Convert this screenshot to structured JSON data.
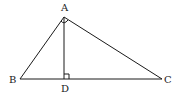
{
  "diagram": {
    "type": "geometry-triangle",
    "points": {
      "A": {
        "label": "A",
        "x": 64,
        "y": 17
      },
      "B": {
        "label": "B",
        "x": 20,
        "y": 79
      },
      "C": {
        "label": "C",
        "x": 162,
        "y": 79
      },
      "D": {
        "label": "D",
        "x": 64,
        "y": 79
      }
    },
    "segments": [
      "AB",
      "AC",
      "BC",
      "AD"
    ],
    "marks": [
      {
        "type": "right-angle",
        "at": "D"
      },
      {
        "type": "angle-arc",
        "at": "A"
      }
    ],
    "colors": {
      "stroke": "#1a1a1a",
      "background": "#ffffff"
    }
  }
}
